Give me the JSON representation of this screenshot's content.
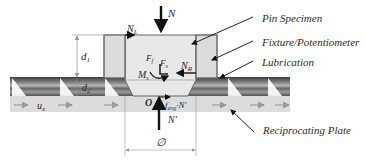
{
  "diagram": {
    "callouts": {
      "pin_specimen": "Pin Specimen",
      "fixture": "Fixture/Potentiometer",
      "lubrication": "Lubrication",
      "plate": "Reciprocating Plate"
    },
    "symbols": {
      "normal_load": "N",
      "left_reaction": "N",
      "left_reaction_sub": "L",
      "right_reaction": "N",
      "right_reaction_sub": "R",
      "force_f": "F",
      "force_f_sub1": "f",
      "force_f2": "F",
      "force_f2_sub": "s",
      "moment": "M",
      "moment_sub": "s",
      "origin": "O",
      "friction": "f",
      "friction_sub": "avg",
      "friction_suffix": "·N'",
      "reaction_bottom": "N'",
      "diameter": "∅",
      "height_d1": "d",
      "height_d1_sub": "1",
      "height_d2": "d",
      "height_d2_sub": "2",
      "velocity": "u",
      "velocity_sub": "x"
    },
    "colors": {
      "outline": "#555555",
      "arrow": "#111111",
      "pin_fill": "#e6e6e6",
      "fixture_fill": "#d9d9d9",
      "plate_fill": "#dcdcdc",
      "lube_dark": "#4a4a4a",
      "lube_mid": "#8a8a8a",
      "dim_line": "#9a9a9a"
    }
  }
}
